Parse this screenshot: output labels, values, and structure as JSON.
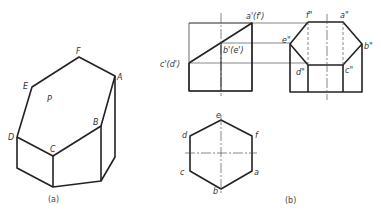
{
  "figure_a": {
    "caption": "(a)",
    "labels": {
      "A": "A",
      "B": "B",
      "C": "C",
      "D": "D",
      "E": "E",
      "F": "F",
      "P": "P"
    }
  },
  "figure_b": {
    "caption": "(b)",
    "front_view_labels": {
      "a": "a'(f')",
      "b": "b'(e')",
      "c": "c'(d')"
    },
    "side_view_labels": {
      "f": "f\"",
      "a": "a\"",
      "e": "e\"",
      "b": "b\"",
      "d": "d\"",
      "c": "c\""
    },
    "top_view_labels": {
      "e": "e",
      "d": "d",
      "f": "f",
      "c": "c",
      "a": "a",
      "b": "b"
    }
  },
  "colors": {
    "line": "#222222",
    "thin": "#555555",
    "background": "#ffffff"
  }
}
